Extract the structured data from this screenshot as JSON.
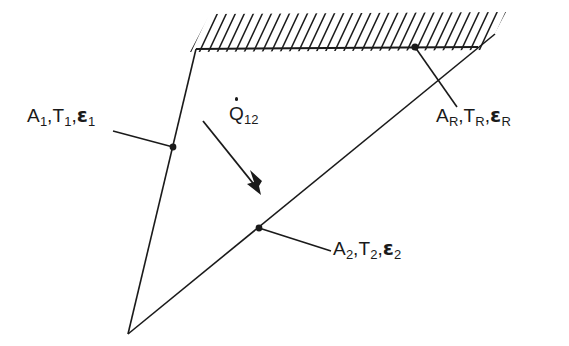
{
  "figure": {
    "background_color": "#ffffff",
    "line_color": "#1a1a1a",
    "text_color": "#1a1a1a"
  },
  "labels": {
    "surface1": {
      "area": "A",
      "area_sub": "1",
      "temp": "T",
      "temp_sub": "1",
      "emissivity": "ε",
      "emissivity_sub": "1",
      "comma": ",",
      "full_text": "A1,T1,ε1"
    },
    "surface2": {
      "area": "A",
      "area_sub": "2",
      "temp": "T",
      "temp_sub": "2",
      "emissivity": "ε",
      "emissivity_sub": "2",
      "comma": ",",
      "full_text": "A2,T2,ε2"
    },
    "surfaceR": {
      "area": "A",
      "area_sub": "R",
      "temp": "T",
      "temp_sub": "R",
      "emissivity": "ε",
      "emissivity_sub": "R",
      "comma": ",",
      "full_text": "AR,TR,εR"
    },
    "heat_flow": {
      "symbol": "Q",
      "sub": "12",
      "full_text": "Q̇12"
    }
  },
  "geometry": {
    "left_surface": {
      "from": [
        196,
        49
      ],
      "to": [
        128,
        334
      ]
    },
    "hatched_surface": {
      "from": [
        196,
        49
      ],
      "to": [
        478,
        47
      ]
    },
    "diagonal_surface": {
      "from": [
        128,
        334
      ],
      "to": [
        495,
        34
      ]
    },
    "hatch_count": 34,
    "markers": [
      {
        "name": "surface1-marker",
        "x": 173,
        "y": 147
      },
      {
        "name": "surface2-marker",
        "x": 259,
        "y": 228
      },
      {
        "name": "surfaceR-marker",
        "x": 415,
        "y": 47
      }
    ],
    "leaders": [
      {
        "name": "surface1-leader",
        "from": [
          113,
          131
        ],
        "to": [
          173,
          147
        ]
      },
      {
        "name": "surfaceR-leader",
        "from": [
          415,
          47
        ],
        "to": [
          457,
          107
        ]
      },
      {
        "name": "surface2-leader",
        "from": [
          259,
          228
        ],
        "to": [
          331,
          251
        ]
      }
    ],
    "arrow": {
      "from": [
        203,
        121
      ],
      "to": [
        261,
        194
      ]
    }
  }
}
